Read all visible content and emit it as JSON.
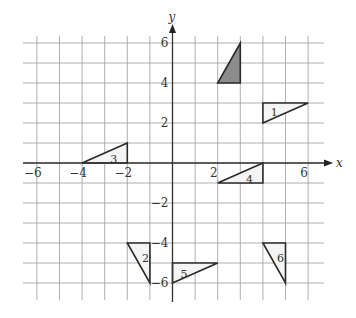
{
  "diagram": {
    "type": "coordinate-grid-transformations",
    "axes": {
      "x_label": "x",
      "y_label": "y",
      "x_range": [
        -6,
        6
      ],
      "y_range": [
        -6,
        6
      ],
      "x_ticks": [
        {
          "value": -6,
          "label": "−6"
        },
        {
          "value": -4,
          "label": "−4"
        },
        {
          "value": -2,
          "label": "−2"
        },
        {
          "value": 2,
          "label": "2"
        },
        {
          "value": 6,
          "label": "6"
        }
      ],
      "y_ticks": [
        {
          "value": 6,
          "label": "6"
        },
        {
          "value": 4,
          "label": "4"
        },
        {
          "value": 2,
          "label": "2"
        },
        {
          "value": -2,
          "label": "−2"
        },
        {
          "value": -4,
          "label": "−4"
        },
        {
          "value": -6,
          "label": "−6"
        }
      ],
      "grid_step": 1
    },
    "colors": {
      "grid": "#9a9a9a",
      "axis": "#333333",
      "outline": "#2a2a2a",
      "object_fill": "#8c8c8c",
      "image_fill": "#f4f4f4"
    },
    "shapes": [
      {
        "id": "object",
        "label": "",
        "shaded": true,
        "vertices": [
          [
            2,
            4
          ],
          [
            3,
            4
          ],
          [
            3,
            6
          ]
        ]
      },
      {
        "id": "T1",
        "label": "1",
        "shaded": false,
        "vertices": [
          [
            4,
            3
          ],
          [
            4,
            2
          ],
          [
            6,
            3
          ]
        ],
        "label_pos": [
          4.35,
          2.55
        ]
      },
      {
        "id": "T2",
        "label": "2",
        "shaded": false,
        "vertices": [
          [
            -2,
            -4
          ],
          [
            -1,
            -4
          ],
          [
            -1,
            -6
          ]
        ],
        "label_pos": [
          -1.35,
          -4.75
        ]
      },
      {
        "id": "T3",
        "label": "3",
        "shaded": false,
        "vertices": [
          [
            -4,
            0
          ],
          [
            -2,
            0
          ],
          [
            -2,
            1
          ]
        ],
        "label_pos": [
          -2.75,
          0.22
        ]
      },
      {
        "id": "T4",
        "label": "4",
        "shaded": false,
        "vertices": [
          [
            2,
            -1
          ],
          [
            4,
            -1
          ],
          [
            4,
            0
          ]
        ],
        "label_pos": [
          3.25,
          -0.78
        ]
      },
      {
        "id": "T5",
        "label": "5",
        "shaded": false,
        "vertices": [
          [
            0,
            -5
          ],
          [
            0,
            -6
          ],
          [
            2,
            -5
          ]
        ],
        "label_pos": [
          0.35,
          -5.55
        ]
      },
      {
        "id": "T6",
        "label": "6",
        "shaded": false,
        "vertices": [
          [
            4,
            -4
          ],
          [
            5,
            -4
          ],
          [
            5,
            -6
          ]
        ],
        "label_pos": [
          4.62,
          -4.75
        ]
      }
    ]
  }
}
